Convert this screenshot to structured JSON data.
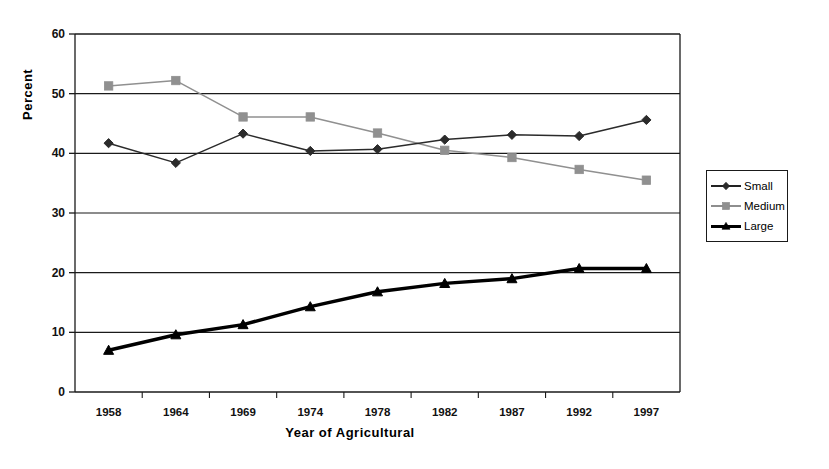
{
  "chart_data": {
    "type": "line",
    "title": "",
    "xlabel": "Year of Agricultural",
    "ylabel": "Percent",
    "categories": [
      "1958",
      "1964",
      "1969",
      "1974",
      "1978",
      "1982",
      "1987",
      "1992",
      "1997"
    ],
    "ylim": [
      0,
      60
    ],
    "yticks": [
      0,
      10,
      20,
      30,
      40,
      50,
      60
    ],
    "grid": true,
    "legend_position": "right",
    "series": [
      {
        "name": "Small",
        "marker": "diamond",
        "color": "#2b2b2b",
        "values": [
          41.7,
          38.4,
          43.3,
          40.4,
          40.7,
          42.3,
          43.1,
          42.9,
          45.6
        ]
      },
      {
        "name": "Medium",
        "marker": "square",
        "color": "#909090",
        "values": [
          51.3,
          52.2,
          46.1,
          46.1,
          43.4,
          40.5,
          39.3,
          37.3,
          35.5
        ]
      },
      {
        "name": "Large",
        "marker": "triangle",
        "color": "#000000",
        "values": [
          7.0,
          9.6,
          11.3,
          14.3,
          16.8,
          18.2,
          19.0,
          20.7,
          20.7
        ]
      }
    ]
  },
  "axes": {
    "y_tick_labels": [
      "60",
      "50",
      "40",
      "30",
      "20",
      "10",
      "0"
    ],
    "x_tick_labels": [
      "1958",
      "1964",
      "1969",
      "1974",
      "1978",
      "1982",
      "1987",
      "1992",
      "1997"
    ],
    "y_axis_title": "Percent",
    "x_axis_title": "Year of Agricultural"
  },
  "legend": {
    "items": [
      {
        "label": "Small"
      },
      {
        "label": "Medium"
      },
      {
        "label": "Large"
      }
    ]
  }
}
